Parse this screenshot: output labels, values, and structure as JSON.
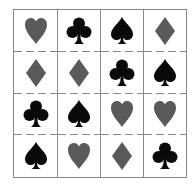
{
  "colors": {
    "red_suit": "#5a5a5a",
    "black_suit": "#0a0a0a",
    "grid_line": "#8a8a8a"
  },
  "grid": {
    "rows": 4,
    "columns": 4,
    "cells": [
      [
        "heart",
        "club",
        "spade",
        "diamond"
      ],
      [
        "diamond",
        "diamond",
        "club",
        "spade"
      ],
      [
        "club",
        "spade",
        "heart",
        "heart"
      ],
      [
        "spade",
        "heart",
        "diamond",
        "club"
      ]
    ]
  }
}
